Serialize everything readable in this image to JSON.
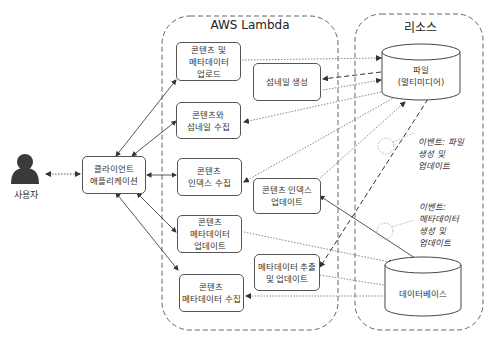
{
  "diagram": {
    "groups": {
      "lambda": {
        "title": "AWS Lambda"
      },
      "resources": {
        "title": "리소스"
      }
    },
    "actor": {
      "label": "사용자"
    },
    "client": {
      "label": "클라이언트\n애플리케이션"
    },
    "lambda_functions": [
      {
        "id": "upload",
        "label": "콘텐츠 및\n메타데이터\n업로드"
      },
      {
        "id": "thumbnail",
        "label": "섬네일 생성"
      },
      {
        "id": "get_content_thumb",
        "label": "콘텐츠와\n섬네일 수집"
      },
      {
        "id": "get_index",
        "label": "콘텐츠\n인덱스 수집"
      },
      {
        "id": "update_index",
        "label": "콘텐츠 인덱스\n업데이트"
      },
      {
        "id": "update_metadata",
        "label": "콘텐츠\n메타데이터\n업데이트"
      },
      {
        "id": "extract_metadata",
        "label": "메타데이터 추출\n및 업데이트"
      },
      {
        "id": "get_metadata",
        "label": "콘텐츠\n메타데이터 수집"
      }
    ],
    "resources": [
      {
        "id": "files",
        "label": "파일\n(멀티미디어)",
        "shape": "cylinder"
      },
      {
        "id": "database",
        "label": "데이터베이스",
        "shape": "cylinder"
      }
    ],
    "events": [
      {
        "id": "file_event",
        "label": "이벤트: 파일\n생성 및\n업데이트"
      },
      {
        "id": "metadata_event",
        "label": "이벤트:\n메타데이터\n생성 및\n업데이트"
      }
    ],
    "colors": {
      "line": "#555555",
      "dotted": "#888888",
      "border": "#555555",
      "actor": "#3a3a3a"
    }
  }
}
